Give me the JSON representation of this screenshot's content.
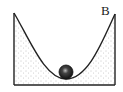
{
  "diagram": {
    "type": "physics-bowl-track",
    "labels": [
      {
        "id": "B",
        "text": "B",
        "x": 101,
        "y": 15
      }
    ],
    "track": {
      "left_top": [
        14,
        13
      ],
      "right_top": [
        115,
        14
      ],
      "bottom_y": 85,
      "lowest_point": [
        66,
        79
      ]
    },
    "ball": {
      "cx": 66,
      "cy": 72,
      "r": 7
    },
    "colors": {
      "stroke": "#222222",
      "ball": "#1a1a1a",
      "fill_dots": "#888888",
      "background": "#ffffff"
    }
  }
}
